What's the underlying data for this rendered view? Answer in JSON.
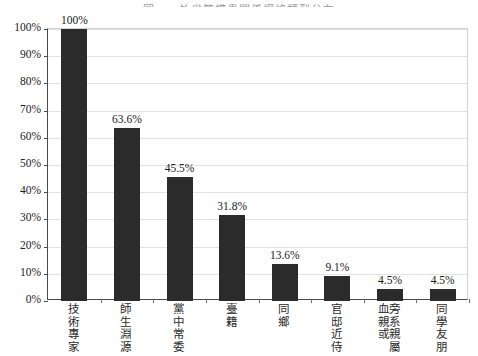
{
  "chart_data": {
    "type": "bar",
    "title": "圖一　外省籍權貴關係網絡類型分布",
    "title_visible_fraction": "clipped at top edge of image",
    "xlabel": "",
    "ylabel": "",
    "ylim": [
      0,
      100
    ],
    "y_unit": "%",
    "grid": true,
    "legend": "none",
    "categories": [
      "技術專家",
      "師生淵源",
      "黨中常委",
      "臺籍",
      "同鄉",
      "官邸近侍",
      "旁系親屬或血親",
      "同學友朋"
    ],
    "category_columns": [
      [
        "技",
        "術",
        "專",
        "家"
      ],
      [
        "師",
        "生",
        "淵",
        "源"
      ],
      [
        "黨",
        "中",
        "常",
        "委"
      ],
      [
        "臺",
        "籍"
      ],
      [
        "同",
        "鄉"
      ],
      [
        "官",
        "邸",
        "近",
        "侍"
      ],
      [
        "旁",
        "系",
        "親",
        "屬"
      ],
      [
        "同",
        "學",
        "友",
        "朋"
      ]
    ],
    "category_columns_second": [
      [],
      [],
      [],
      [],
      [],
      [],
      [
        "血",
        "親",
        "或"
      ],
      []
    ],
    "values": [
      100,
      63.6,
      45.5,
      31.8,
      13.6,
      9.1,
      4.5,
      4.5
    ],
    "value_labels": [
      "100%",
      "63.6%",
      "45.5%",
      "31.8%",
      "13.6%",
      "9.1%",
      "4.5%",
      "4.5%"
    ],
    "y_ticks": [
      0,
      10,
      20,
      30,
      40,
      50,
      60,
      70,
      80,
      90,
      100
    ],
    "y_tick_labels": [
      "0%",
      "10%",
      "20%",
      "30%",
      "40%",
      "50%",
      "60%",
      "70%",
      "80%",
      "90%",
      "100%"
    ],
    "colors": {
      "bar": "#2b2b2b",
      "gridline": "#e2e2e2",
      "axis": "#4a4a4a",
      "background": "#ffffff",
      "text": "#1a1a1a"
    }
  }
}
